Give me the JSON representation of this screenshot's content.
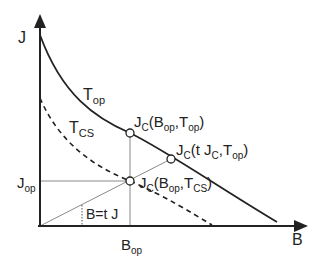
{
  "diagram": {
    "axes": {
      "y_label": "J",
      "x_label": "B"
    },
    "curves": [
      {
        "name": "Top-curve",
        "label": "T",
        "label_sub": "op",
        "style": "solid"
      },
      {
        "name": "Tcs-curve",
        "label": "T",
        "label_sub": "CS",
        "style": "dashed"
      }
    ],
    "points": [
      {
        "label_main": "J",
        "label_sub": "C",
        "args": [
          {
            "t": "(B",
            "s": "op"
          },
          {
            "t": ",T",
            "s": "op"
          },
          {
            "t": ")",
            "s": ""
          }
        ]
      },
      {
        "label_main": "J",
        "label_sub": "C",
        "args": [
          {
            "t": "(t J",
            "s": "C"
          },
          {
            "t": ",T",
            "s": "op"
          },
          {
            "t": ")",
            "s": ""
          }
        ]
      },
      {
        "label_main": "J",
        "label_sub": "C",
        "args": [
          {
            "t": "(B",
            "s": "op"
          },
          {
            "t": ",T",
            "s": "CS"
          },
          {
            "t": ")",
            "s": ""
          }
        ]
      }
    ],
    "reference_labels": {
      "jop_main": "J",
      "jop_sub": "op",
      "bop_main": "B",
      "bop_sub": "op",
      "load_line": "B=t J"
    },
    "colors": {
      "ink": "#222222",
      "guide": "#8a8a8a"
    }
  }
}
